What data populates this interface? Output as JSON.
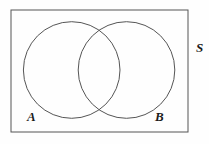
{
  "figure": {
    "kind": "venn-diagram",
    "background_color": "#fefefe",
    "stroke_color": "#555555",
    "label_color": "#1c1c1c",
    "stroke_width": 1,
    "canvas": {
      "width": 209,
      "height": 144
    }
  },
  "universal_set": {
    "name": "universal-set-rectangle",
    "label": "S",
    "label_x": 196,
    "label_y": 52,
    "label_size": 13,
    "x": 11,
    "y": 10,
    "width": 177,
    "height": 122
  },
  "sets": [
    {
      "name": "set-a-circle",
      "label": "A",
      "cx": 71.7,
      "cy": 70,
      "r": 48.3,
      "label_x": 27,
      "label_y": 121,
      "label_size": 13
    },
    {
      "name": "set-b-circle",
      "label": "B",
      "cx": 126.5,
      "cy": 70,
      "r": 48.3,
      "label_x": 155,
      "label_y": 121,
      "label_size": 13
    }
  ]
}
